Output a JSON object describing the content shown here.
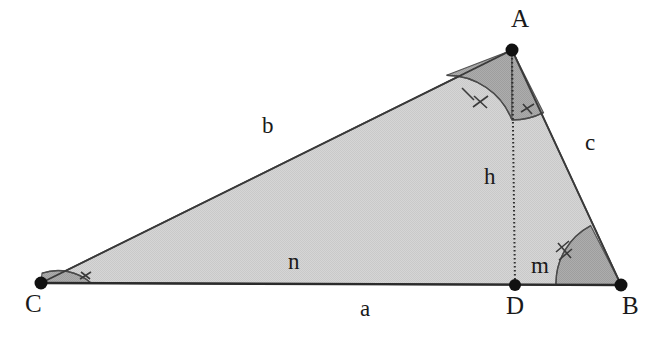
{
  "figure": {
    "type": "geometry-diagram",
    "background_color": "#ffffff",
    "fill_color": "#d4d4d4",
    "angle_fill_color": "#a8a8a8",
    "stroke_color": "#2b2b2b",
    "text_color": "#1a1a1a"
  },
  "vertices": [
    {
      "name": "A",
      "label": "A",
      "x": 512,
      "y": 50,
      "label_x": 515,
      "label_y": 8
    },
    {
      "name": "B",
      "label": "B",
      "x": 621,
      "y": 285,
      "label_x": 624,
      "label_y": 296
    },
    {
      "name": "C",
      "label": "C",
      "x": 41,
      "y": 283,
      "label_x": 30,
      "label_y": 295
    },
    {
      "name": "D",
      "label": "D",
      "x": 515,
      "y": 285,
      "label_x": 510,
      "label_y": 296
    }
  ],
  "sides": [
    {
      "name": "side-b",
      "label": "b",
      "label_x": 263,
      "label_y": 116,
      "between": "C-A"
    },
    {
      "name": "side-c",
      "label": "c",
      "label_x": 584,
      "label_y": 132,
      "between": "A-B"
    },
    {
      "name": "side-a",
      "label": "a",
      "label_x": 361,
      "label_y": 299,
      "between": "C-B"
    },
    {
      "name": "altitude-h",
      "label": "h",
      "label_x": 486,
      "label_y": 167,
      "between": "A-D"
    },
    {
      "name": "segment-n",
      "label": "n",
      "label_x": 289,
      "label_y": 251,
      "between": "C-D"
    },
    {
      "name": "segment-m",
      "label": "m",
      "label_x": 533,
      "label_y": 254,
      "between": "D-B"
    }
  ],
  "angles": [
    {
      "name": "angle-C",
      "at": "C",
      "ticks": 1,
      "congruent_with": "angle-DAB"
    },
    {
      "name": "angle-B",
      "at": "B",
      "ticks": 2,
      "congruent_with": "angle-CAD"
    },
    {
      "name": "angle-CAD",
      "at": "A",
      "ticks": 2,
      "congruent_with": "angle-B"
    },
    {
      "name": "angle-DAB",
      "at": "A",
      "ticks": 1,
      "congruent_with": "angle-C"
    }
  ],
  "altitude": {
    "name": "altitude-AD",
    "style": "dotted",
    "from": "A",
    "to": "D"
  }
}
